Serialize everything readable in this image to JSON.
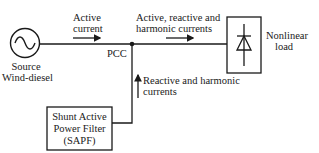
{
  "diagram": {
    "source": {
      "line1": "Source",
      "line2": "Wind-diesel",
      "icon": "ac-source-icon"
    },
    "active_current": {
      "line1": "Active",
      "line2": "current"
    },
    "pcc": "PCC",
    "load_currents": {
      "line1": "Active, reactive and",
      "line2": "harmonic currents"
    },
    "load": {
      "line1": "Nonlinear",
      "line2": "load",
      "icon": "diode-icon"
    },
    "filter_currents": {
      "line1": "Reactive and harmonic",
      "line2": "currents"
    },
    "sapf": {
      "line1": "Shunt Active",
      "line2": "Power Filter",
      "line3": "(SAPF)"
    },
    "colors": {
      "line": "#1a1a1a",
      "background": "#ffffff"
    }
  }
}
